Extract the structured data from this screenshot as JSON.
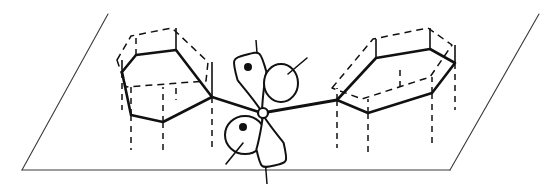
{
  "figure": {
    "width": 557,
    "height": 188,
    "background_color": "#ffffff",
    "line_color": "#111111",
    "plane_color": "#3a3a3a"
  },
  "plane": {
    "name": "reference-plane",
    "left_edge": {
      "x1": 108,
      "y1": 14,
      "x2": 22,
      "y2": 170
    },
    "bottom_edge": {
      "x1": 22,
      "y1": 170,
      "x2": 450,
      "y2": 170
    },
    "right_edge": {
      "x1": 450,
      "y1": 170,
      "x2": 539,
      "y2": 14
    },
    "top_edge_drawn": false
  },
  "left_ring": {
    "name": "left-benzene-ring",
    "label": "phenyl ring (left)",
    "solid_hexagon": [
      [
        122,
        72
      ],
      [
        136,
        55
      ],
      [
        176,
        50
      ],
      [
        212,
        97
      ],
      [
        163,
        122
      ],
      [
        131,
        115
      ]
    ],
    "dashed_hexagon": [
      [
        117,
        60
      ],
      [
        131,
        36
      ],
      [
        172,
        28
      ],
      [
        208,
        62
      ],
      [
        206,
        81
      ],
      [
        126,
        87
      ]
    ],
    "risers_solid": [
      {
        "x": 122,
        "y1": 72,
        "y2": 60
      },
      {
        "x": 176,
        "y1": 50,
        "y2": 28
      },
      {
        "x": 212,
        "y1": 97,
        "y2": 62
      }
    ],
    "risers_dashed_up": [
      {
        "x": 136,
        "y1": 55,
        "y2": 36
      },
      {
        "x": 163,
        "y1": 122,
        "y2": 87
      },
      {
        "x": 131,
        "y1": 115,
        "y2": 87
      }
    ],
    "risers_dashed_down": [
      {
        "x": 122,
        "y1": 72,
        "y2": 110
      },
      {
        "x": 131,
        "y1": 115,
        "y2": 150
      },
      {
        "x": 163,
        "y1": 122,
        "y2": 155
      },
      {
        "x": 212,
        "y1": 97,
        "y2": 148
      },
      {
        "x": 176,
        "y1": 88,
        "y2": 100
      }
    ],
    "bond_to_center": {
      "x1": 212,
      "y1": 97,
      "x2": 262,
      "y2": 113
    }
  },
  "right_ring": {
    "name": "right-benzene-ring",
    "label": "phenyl ring (right)",
    "solid_hexagon": [
      [
        337,
        100
      ],
      [
        376,
        58
      ],
      [
        430,
        49
      ],
      [
        455,
        63
      ],
      [
        432,
        93
      ],
      [
        368,
        113
      ]
    ],
    "dashed_hexagon": [
      [
        332,
        88
      ],
      [
        373,
        39
      ],
      [
        428,
        28
      ],
      [
        452,
        45
      ],
      [
        430,
        77
      ],
      [
        362,
        99
      ]
    ],
    "risers_solid": [
      {
        "x": 376,
        "y1": 58,
        "y2": 39
      },
      {
        "x": 430,
        "y1": 49,
        "y2": 28
      },
      {
        "x": 455,
        "y1": 63,
        "y2": 45
      }
    ],
    "risers_dashed_up": [
      {
        "x": 337,
        "y1": 100,
        "y2": 88
      },
      {
        "x": 432,
        "y1": 93,
        "y2": 77
      },
      {
        "x": 368,
        "y1": 113,
        "y2": 99
      }
    ],
    "risers_dashed_down": [
      {
        "x": 337,
        "y1": 100,
        "y2": 148
      },
      {
        "x": 368,
        "y1": 113,
        "y2": 152
      },
      {
        "x": 432,
        "y1": 93,
        "y2": 148
      },
      {
        "x": 455,
        "y1": 63,
        "y2": 110
      },
      {
        "x": 400,
        "y1": 70,
        "y2": 90
      }
    ],
    "bond_to_center": {
      "x1": 262,
      "y1": 113,
      "x2": 337,
      "y2": 100
    }
  },
  "center": {
    "name": "carbene-carbon",
    "label": "divalent carbon center",
    "x": 263,
    "y": 113,
    "radius": 5
  },
  "axis": {
    "name": "vertical-axis",
    "label": "perpendicular axis through carbene center",
    "x_top": 256,
    "y_top": 40,
    "x_bottom": 267,
    "y_bottom": 184
  },
  "orbitals": [
    {
      "name": "upper-sigma-lobe",
      "label": "upper teardrop lobe (singly occupied)",
      "type": "teardrop",
      "apex": {
        "x": 262,
        "y": 112
      },
      "bulb_center": {
        "x": 252,
        "y": 76
      },
      "bulb_rx": 15,
      "bulb_ry": 22,
      "electron_dot": {
        "x": 248,
        "y": 67,
        "r": 4
      },
      "has_tail": false
    },
    {
      "name": "upper-p-lobe",
      "label": "upper rounded lobe with tail",
      "type": "round",
      "center": {
        "x": 281,
        "y": 83
      },
      "rx": 17,
      "ry": 19,
      "electron_dot": null,
      "tail": {
        "x1": 288,
        "y1": 74,
        "x2": 307,
        "y2": 58
      }
    },
    {
      "name": "lower-p-lobe",
      "label": "lower rounded lobe with tail and electron",
      "type": "round",
      "center": {
        "x": 245,
        "y": 135
      },
      "rx": 20,
      "ry": 19,
      "electron_dot": {
        "x": 243,
        "y": 127,
        "r": 4
      },
      "tail": {
        "x1": 243,
        "y1": 143,
        "x2": 226,
        "y2": 164
      }
    },
    {
      "name": "lower-sigma-lobe",
      "label": "lower teardrop lobe (singly occupied)",
      "type": "teardrop",
      "apex": {
        "x": 263,
        "y": 115
      },
      "bulb_center": {
        "x": 270,
        "y": 146
      },
      "bulb_rx": 14,
      "bulb_ry": 20,
      "electron_dot": null,
      "has_tail": false
    }
  ],
  "electron_count": 2
}
